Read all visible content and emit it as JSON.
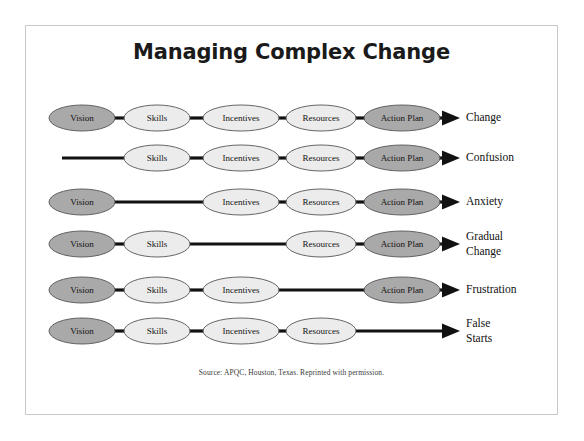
{
  "title": "Managing Complex Change",
  "source_note": "Source: APQC, Houston, Texas. Reprinted with permission.",
  "colors": {
    "node_dark_fill": "#a9a9a9",
    "node_light_fill": "#ececec",
    "node_stroke": "#555555",
    "connector": "#111111",
    "frame_border": "#c9c9c9",
    "background": "#ffffff",
    "text": "#111111"
  },
  "columns": [
    {
      "key": "vision",
      "label": "Vision",
      "cx": 82,
      "rx": 33,
      "shade": "dark"
    },
    {
      "key": "skills",
      "label": "Skills",
      "cx": 157,
      "rx": 33,
      "shade": "light"
    },
    {
      "key": "incentives",
      "label": "Incentives",
      "cx": 241,
      "rx": 38,
      "shade": "light"
    },
    {
      "key": "resources",
      "label": "Resources",
      "cx": 321,
      "rx": 35,
      "shade": "light"
    },
    {
      "key": "actionplan",
      "label": "Action Plan",
      "cx": 402,
      "rx": 38,
      "shade": "dark"
    }
  ],
  "geometry": {
    "ry": 13,
    "arrow_tip_x": 460,
    "arrow_tail_x": 442,
    "outcome_label_x": 466,
    "row_ys": [
      118,
      158,
      202,
      244,
      290,
      331
    ],
    "stub_start_x": 62
  },
  "chart_data": {
    "type": "diagram",
    "title": "Managing Complex Change",
    "elements": [
      "Vision",
      "Skills",
      "Incentives",
      "Resources",
      "Action Plan"
    ],
    "rows": [
      {
        "missing": null,
        "present": [
          "Vision",
          "Skills",
          "Incentives",
          "Resources",
          "Action Plan"
        ],
        "outcome": [
          "Change"
        ]
      },
      {
        "missing": "Vision",
        "present": [
          "Skills",
          "Incentives",
          "Resources",
          "Action Plan"
        ],
        "outcome": [
          "Confusion"
        ]
      },
      {
        "missing": "Skills",
        "present": [
          "Vision",
          "Incentives",
          "Resources",
          "Action Plan"
        ],
        "outcome": [
          "Anxiety"
        ]
      },
      {
        "missing": "Incentives",
        "present": [
          "Vision",
          "Skills",
          "Resources",
          "Action Plan"
        ],
        "outcome": [
          "Gradual",
          "Change"
        ]
      },
      {
        "missing": "Resources",
        "present": [
          "Vision",
          "Skills",
          "Incentives",
          "Action Plan"
        ],
        "outcome": [
          "Frustration"
        ]
      },
      {
        "missing": "Action Plan",
        "present": [
          "Vision",
          "Skills",
          "Incentives",
          "Resources"
        ],
        "outcome": [
          "False",
          "Starts"
        ]
      }
    ]
  }
}
